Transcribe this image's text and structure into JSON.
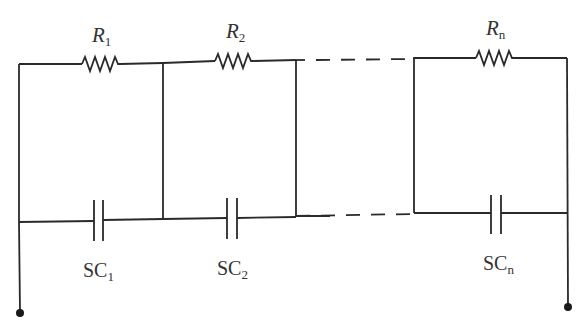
{
  "diagram": {
    "type": "circuit",
    "resistors": [
      {
        "label": "R",
        "sub": "1"
      },
      {
        "label": "R",
        "sub": "2"
      },
      {
        "label": "R",
        "sub": "n"
      }
    ],
    "capacitors": [
      {
        "label": "SC",
        "sub": "1"
      },
      {
        "label": "SC",
        "sub": "2"
      },
      {
        "label": "SC",
        "sub": "n"
      }
    ],
    "terminals": [
      "left-terminal",
      "right-terminal"
    ],
    "colors": {
      "line": "#2a2a2a",
      "text": "#333333",
      "background": "#ffffff"
    }
  }
}
